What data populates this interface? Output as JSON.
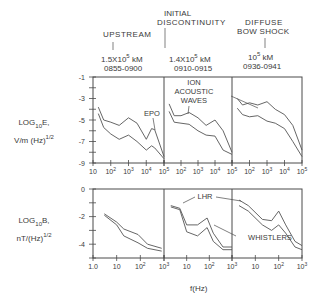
{
  "header": {
    "regions": [
      {
        "name": "UPSTREAM",
        "distance_base": "1.5X10",
        "distance_exp": "5",
        "distance_unit": "kM",
        "time": "0855-0900"
      },
      {
        "name_line1": "INITIAL",
        "name_line2": "DISCONTINUITY",
        "distance_base": "1.4X10",
        "distance_exp": "5",
        "distance_unit": "kM",
        "time": "0910-0915"
      },
      {
        "name_line1": "DIFFUSE",
        "name_line2": "BOW SHOCK",
        "distance_base": "10",
        "distance_exp": "5",
        "distance_unit": "kM",
        "time": "0936-0941"
      }
    ]
  },
  "axes": {
    "top_ylabel_line1": "LOG",
    "top_ylabel_sub": "10",
    "top_ylabel_tail": "E,",
    "top_ylabel_line2": "V/m (Hz)",
    "top_ylabel_exp": "1/2",
    "bottom_ylabel_line1": "LOG",
    "bottom_ylabel_sub": "10",
    "bottom_ylabel_tail": "B,",
    "bottom_ylabel_line2": "nT/(Hz)",
    "bottom_ylabel_exp": "1/2",
    "xlabel": "f(Hz)"
  },
  "annotations": {
    "epo": "EPO",
    "ion_line1": "ION",
    "ion_line2": "ACOUSTIC",
    "ion_line3": "WAVES",
    "lhr": "LHR",
    "whistlers": "WHISTLERS"
  },
  "chart_data": [
    {
      "type": "line",
      "title": "Electric field spectra",
      "ylabel": "LOG10 E, V/m (Hz)^1/2",
      "xlabel": "f(Hz)",
      "x_scale": "log",
      "xlim": [
        10,
        100000
      ],
      "ylim": [
        -9,
        -1
      ],
      "yticks": [
        -1,
        -3,
        -5,
        -7,
        -9
      ],
      "xticks": [
        "10",
        "10^2",
        "10^3",
        "10^4",
        "10^5"
      ],
      "panels": [
        {
          "region": "UPSTREAM",
          "x": [
            20,
            40,
            100,
            300,
            1000,
            3000,
            10000,
            20000,
            30000,
            100000
          ],
          "series": [
            {
              "name": "upper",
              "values": [
                -3.8,
                -5.0,
                -5.2,
                -5.5,
                -4.8,
                -5.3,
                -6.8,
                -5.8,
                -5.9,
                -8.4
              ]
            },
            {
              "name": "lower",
              "values": [
                -4.4,
                -5.7,
                -6.3,
                -6.8,
                -6.4,
                -7.0,
                -7.8,
                -7.4,
                -7.6,
                -8.6
              ]
            }
          ]
        },
        {
          "region": "INITIAL DISCONTINUITY",
          "x": [
            20,
            40,
            100,
            300,
            1000,
            3000,
            10000,
            30000,
            100000
          ],
          "series": [
            {
              "name": "upper",
              "values": [
                -3.5,
                -4.6,
                -4.6,
                -4.3,
                -4.8,
                -5.5,
                -5.0,
                -6.0,
                -8.0
              ]
            },
            {
              "name": "lower",
              "values": [
                -4.2,
                -5.2,
                -5.3,
                -5.4,
                -6.0,
                -6.4,
                -6.5,
                -7.8,
                -8.2
              ]
            }
          ]
        },
        {
          "region": "DIFFUSE BOW SHOCK",
          "x": [
            20,
            40,
            100,
            300,
            1000,
            3000,
            10000,
            30000,
            100000
          ],
          "series": [
            {
              "name": "upper",
              "values": [
                -3.0,
                -3.6,
                -3.4,
                -3.6,
                -3.3,
                -4.0,
                -4.5,
                -5.5,
                -7.8
              ]
            },
            {
              "name": "lower",
              "values": [
                -3.9,
                -4.5,
                -4.7,
                -4.6,
                -5.1,
                -5.3,
                -5.8,
                -7.0,
                -8.4
              ]
            }
          ]
        }
      ]
    },
    {
      "type": "line",
      "title": "Magnetic field spectra",
      "ylabel": "LOG10 B, nT/(Hz)^1/2",
      "xlabel": "f(Hz)",
      "x_scale": "log",
      "xlim": [
        1,
        1000
      ],
      "ylim": [
        -5,
        0
      ],
      "yticks": [
        0,
        -2,
        -4
      ],
      "xticks": [
        "1.0",
        "10",
        "10^2",
        "10^3"
      ],
      "panels": [
        {
          "region": "UPSTREAM",
          "x": [
            3,
            10,
            20,
            80,
            200,
            800
          ],
          "series": [
            {
              "name": "upper",
              "values": [
                -1.8,
                -2.4,
                -2.9,
                -3.3,
                -4.0,
                -4.3
              ]
            },
            {
              "name": "lower",
              "values": [
                -1.9,
                -2.6,
                -3.4,
                -3.9,
                -4.3,
                -4.5
              ]
            }
          ]
        },
        {
          "region": "INITIAL DISCONTINUITY",
          "x": [
            2,
            5,
            10,
            30,
            80,
            150,
            400,
            1000
          ],
          "series": [
            {
              "name": "upper",
              "values": [
                -1.2,
                -1.4,
                -2.6,
                -2.6,
                -2.1,
                -3.2,
                -4.2,
                -4.2
              ]
            },
            {
              "name": "lower",
              "values": [
                -1.3,
                -1.5,
                -3.1,
                -3.4,
                -2.8,
                -3.8,
                -4.4,
                -4.4
              ]
            }
          ]
        },
        {
          "region": "DIFFUSE BOW SHOCK",
          "x": [
            2,
            5,
            20,
            50,
            100,
            200,
            500,
            1000
          ],
          "series": [
            {
              "name": "upper",
              "values": [
                -0.8,
                -1.2,
                -2.2,
                -2.3,
                -1.6,
                -2.6,
                -3.8,
                -4.1
              ]
            },
            {
              "name": "lower",
              "values": [
                -1.2,
                -1.6,
                -2.6,
                -3.0,
                -2.6,
                -3.2,
                -4.2,
                -4.4
              ]
            }
          ]
        }
      ]
    }
  ]
}
